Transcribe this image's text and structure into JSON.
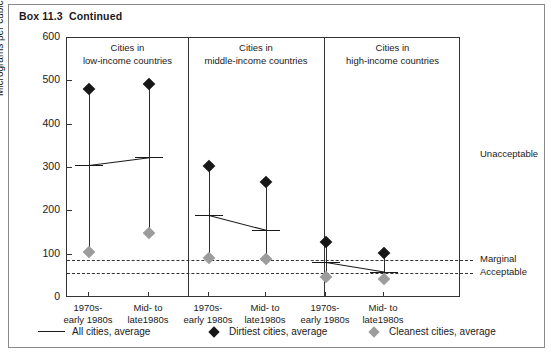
{
  "box_title": "Box 11.3  Continued",
  "axis": {
    "y_label": "Micrograms per cubic metre of air",
    "y_ticks": [
      "0",
      "100",
      "200",
      "300",
      "400",
      "500",
      "600"
    ]
  },
  "panels": [
    {
      "title_line1": "Cities in",
      "title_line2": "low-income countries"
    },
    {
      "title_line1": "Cities in",
      "title_line2": "middle-income countries"
    },
    {
      "title_line1": "Cities in",
      "title_line2": "high-income countries"
    }
  ],
  "x_ticks": [
    {
      "line1": "1970s-",
      "line2": "early 1980s"
    },
    {
      "line1": "Mid- to",
      "line2": "late1980s"
    },
    {
      "line1": "1970s-",
      "line2": "early 1980s"
    },
    {
      "line1": "Mid- to",
      "line2": "late1980s"
    },
    {
      "line1": "1970s-",
      "line2": "early 1980s"
    },
    {
      "line1": "Mid- to",
      "line2": "late1980s"
    }
  ],
  "thresholds": [
    {
      "label": "Marginal",
      "value": 88
    },
    {
      "label": "Acceptable",
      "value": 58
    }
  ],
  "zone_labels": [
    {
      "label": "Unacceptable",
      "value": 330
    }
  ],
  "legend": [
    {
      "marker": "line",
      "label": "All cities, average",
      "color": "#1a1a1a"
    },
    {
      "marker": "diamond",
      "label": "Dirtiest cities, average",
      "color": "#171717"
    },
    {
      "marker": "diamond",
      "label": "Cleanest cities, average",
      "color": "#9c9c9c"
    }
  ],
  "chart_data": {
    "type": "line",
    "title": "Box 11.3  Continued",
    "xlabel": "",
    "ylabel": "Micrograms per cubic metre of air",
    "ylim": [
      0,
      600
    ],
    "grid": false,
    "legend_position": "bottom",
    "panel_groups": [
      "Cities in low-income countries",
      "Cities in middle-income countries",
      "Cities in high-income countries"
    ],
    "categories": [
      "1970s-early 1980s (low-income)",
      "Mid- to late1980s (low-income)",
      "1970s-early 1980s (middle-income)",
      "Mid- to late1980s (middle-income)",
      "1970s-early 1980s (high-income)",
      "Mid- to late1980s (high-income)"
    ],
    "series": [
      {
        "name": "Dirtiest cities, average",
        "values": [
          483,
          494,
          305,
          267,
          130,
          105
        ]
      },
      {
        "name": "All cities, average",
        "values": [
          307,
          325,
          191,
          157,
          82,
          60
        ]
      },
      {
        "name": "Cleanest cities, average",
        "values": [
          106,
          149,
          92,
          89,
          48,
          45
        ]
      }
    ],
    "threshold_lines": [
      {
        "name": "Marginal",
        "value": 88
      },
      {
        "name": "Acceptable",
        "value": 58
      }
    ],
    "annotations": [
      "Unacceptable",
      "Marginal",
      "Acceptable"
    ]
  }
}
